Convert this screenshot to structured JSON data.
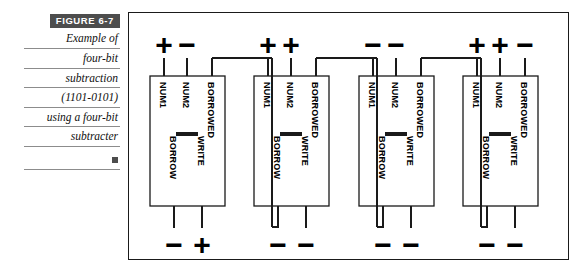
{
  "figure": {
    "tag_label": "FIGURE  6-7",
    "tag_bg": "#4d4d4d",
    "tag_fg": "#ffffff",
    "caption_lines": [
      "Example of",
      "four-bit",
      "subtraction",
      "(1101-0101)",
      "using a four-bit",
      "subtracter"
    ],
    "end_marker": "square-marker"
  },
  "diagram": {
    "type": "logic-circuit-schematic",
    "line_color": "#1a1a1a",
    "block_count": 4,
    "port_labels": {
      "in1": "NUM1",
      "in2": "NUM2",
      "in3": "BORROWED",
      "out1": "BORROW",
      "out2": "WRITE"
    },
    "block_body_symbol": "—",
    "blocks": [
      {
        "name": "subtracter-bit-0",
        "top_signs": [
          "+",
          "−"
        ],
        "bottom_signs": [
          "−",
          "+"
        ],
        "borrowed_chained": true
      },
      {
        "name": "subtracter-bit-1",
        "top_signs": [
          "+",
          "+"
        ],
        "bottom_signs": [
          "−",
          "−"
        ],
        "borrowed_chained": true
      },
      {
        "name": "subtracter-bit-2",
        "top_signs": [
          "−",
          "−"
        ],
        "bottom_signs": [
          "−",
          "−"
        ],
        "borrowed_chained": true
      },
      {
        "name": "subtracter-bit-3",
        "top_signs": [
          "+",
          "+",
          "−"
        ],
        "bottom_signs": [
          "−",
          "−"
        ],
        "borrowed_chained": false
      }
    ]
  }
}
